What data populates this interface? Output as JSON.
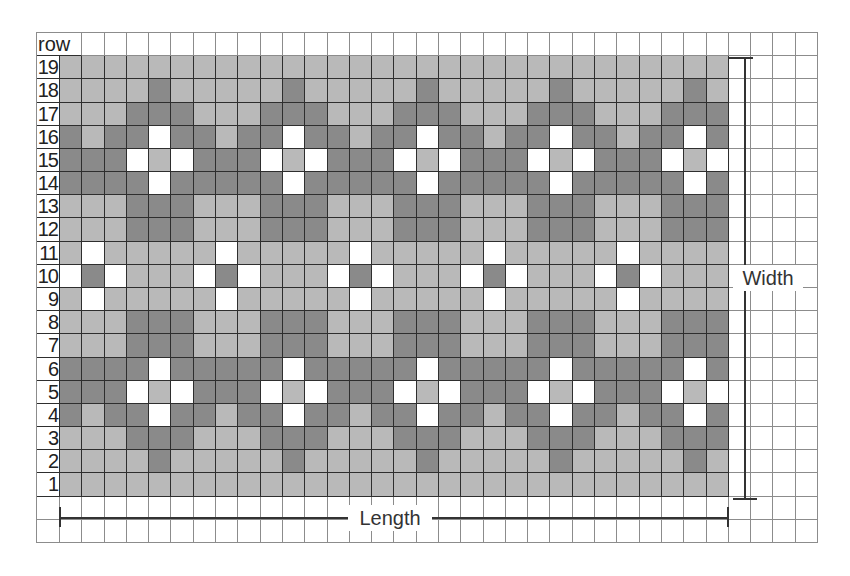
{
  "diagram": {
    "header_label": "row",
    "row_numbers": [
      "19",
      "18",
      "17",
      "16",
      "15",
      "14",
      "13",
      "12",
      "11",
      "10",
      "9",
      "8",
      "7",
      "6",
      "5",
      "4",
      "3",
      "2",
      "1"
    ],
    "pattern_columns": 30,
    "extra_empty_columns": 4,
    "extra_empty_rows": 2,
    "legend": {
      "L": "light grey",
      "D": "dark grey",
      "W": "white"
    },
    "colors": {
      "light": "#b9b9b9",
      "dark": "#8a8a8a",
      "white": "#ffffff",
      "grid_dark": "#2e2e2e",
      "grid_light": "#8c8c8c"
    },
    "pattern_rows": [
      "LLLLLLLLLLLLLLLLLLLLLLLLLLLLLL",
      "LLLLDLLLLLDLLLLLDLLLLLDLLLLLDL",
      "LLLDDDLLLDDDLLLDDDLLLDDDLLLDDD",
      "DLDDWDDLDDWDDLDDWDDLDDWDDLDDWD",
      "DDDWLWDDDWLWDDDWLWDDDWLWDDDWLW",
      "DDDDWDDDDDWDDDDDWDDDDDWDDDDDWD",
      "LLLDDDLLLDDDLLLDDDLLLDDDLLLDDD",
      "LLLDDDLLLDDDLLLDDDLLLDDDLLLDDD",
      "LWLLLLLWLLLLLWLLLLLWLLLLLWLLLL",
      "WDWLLLWDWLLLWDWLLLWDWLLLWDWLLL",
      "LWLLLLLWLLLLLWLLLLLWLLLLLWLLLL",
      "LLLDDDLLLDDDLLLDDDLLLDDDLLLDDD",
      "LLLDDDLLLDDDLLLDDDLLLDDDLLLDDD",
      "DDDDWDDDDDWDDDDDWDDDDDWDDDDDWD",
      "DDDWLWDDDWLWDDDWLWDDDWLWDDDWLW",
      "DLDDWDDLDDWDDLDDWDDLDDWDDLDDWD",
      "LLLDDDLLLDDDLLLDDDLLLDDDLLLDDD",
      "LLLLDLLLLLDLLLLLDLLLLLDLLLLLDL",
      "LLLLLLLLLLLLLLLLLLLLLLLLLLLLLL"
    ],
    "width_label": "Width",
    "length_label": "Length"
  }
}
